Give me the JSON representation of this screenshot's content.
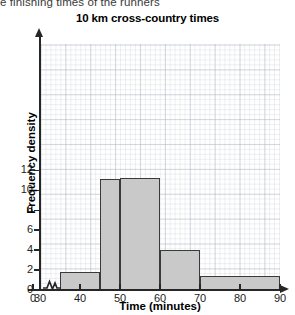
{
  "intro_text": "e finishing times of the runners",
  "chart_data": {
    "type": "bar",
    "title": "10 km cross-country times",
    "xlabel": "Time (minutes)",
    "ylabel": "Frequency density",
    "xlim": [
      30,
      90
    ],
    "ylim": [
      0,
      12.6
    ],
    "grid": true,
    "legend": "none",
    "x_axis_break": true,
    "x_axis_break_label": "zigzag-break-between-0-and-30",
    "x_ticks": [
      0,
      30,
      40,
      50,
      60,
      70,
      80,
      90
    ],
    "y_ticks": [
      0,
      2,
      4,
      6,
      8,
      10,
      12
    ],
    "bar_fill_color": "#c9c9c9",
    "bar_edge_color": "#3a3a3a",
    "grid_color": "#aab2be",
    "bins": [
      {
        "label": "35-45",
        "start": 35,
        "end": 45,
        "value": 1.8
      },
      {
        "label": "45-50",
        "start": 45,
        "end": 50,
        "value": 11.1
      },
      {
        "label": "50-60",
        "start": 50,
        "end": 60,
        "value": 11.2
      },
      {
        "label": "60-70",
        "start": 60,
        "end": 70,
        "value": 4.0
      },
      {
        "label": "70-90",
        "start": 70,
        "end": 90,
        "value": 1.4
      }
    ],
    "categories": [
      "35-45",
      "45-50",
      "50-60",
      "60-70",
      "70-90"
    ],
    "values": [
      1.8,
      11.1,
      11.2,
      4.0,
      1.4
    ]
  }
}
